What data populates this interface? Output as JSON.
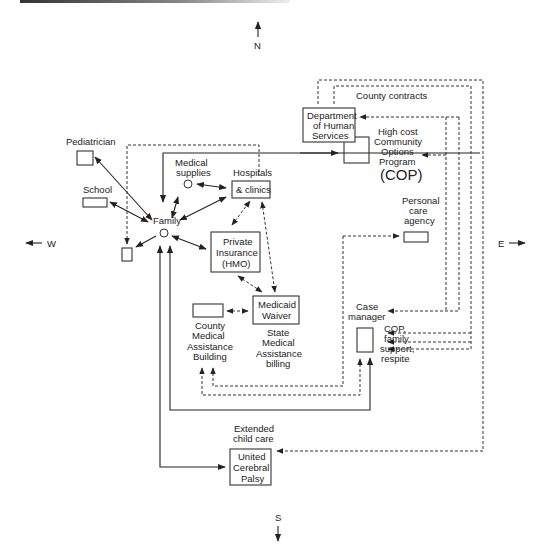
{
  "compass": {
    "north": "N",
    "south": "S",
    "east": "E",
    "west": "W"
  },
  "nodes": {
    "pediatrician": "Pediatrician",
    "school": "School",
    "family": "Family",
    "medical_supplies": [
      "Medical",
      "supplies"
    ],
    "hospitals": [
      "Hospitals",
      "& clinics"
    ],
    "private_insurance": [
      "Private",
      "Insurance",
      "(HMO)"
    ],
    "medicaid_waiver": [
      "Medicaid",
      "Waiver"
    ],
    "state_billing": [
      "State",
      "Medical",
      "Assistance",
      "billing"
    ],
    "county_building": [
      "County",
      "Medical",
      "Assistance",
      "Building"
    ],
    "dhs": [
      "Department",
      "of Human",
      "Services"
    ],
    "county_contracts": "County contracts",
    "cop": [
      "High cost",
      "Community",
      "Options",
      "Program",
      "(COP)"
    ],
    "personal_care": [
      "Personal",
      "care",
      "agency"
    ],
    "case_manager": [
      "Case",
      "manager"
    ],
    "cop_family": [
      "COP,",
      "family",
      "support,",
      "respite"
    ],
    "extended_care": [
      "Extended",
      "child care"
    ],
    "ucp": [
      "United",
      "Cerebral",
      "Palsy"
    ]
  },
  "legend": {
    "solid_line": "direct connection",
    "dashed_line": "indirect / funding connection"
  }
}
